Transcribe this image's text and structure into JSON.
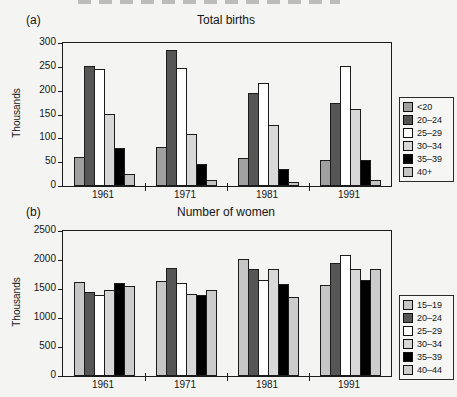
{
  "figure": {
    "description_note": "scanned two-panel grayscale bar chart figure",
    "background_color": "#f4f4f2"
  },
  "chart_data": [
    {
      "type": "bar",
      "panel_label": "(a)",
      "title": "Total births",
      "xlabel": "",
      "ylabel": "Thousands",
      "ylim": [
        0,
        300
      ],
      "ytick_step": 50,
      "grid": false,
      "legend_position": "right",
      "categories": [
        "1961",
        "1971",
        "1981",
        "1991"
      ],
      "series": [
        {
          "name": "<20",
          "color": "#a0a0a0",
          "values": [
            60,
            82,
            58,
            54
          ]
        },
        {
          "name": "20–24",
          "color": "#565656",
          "values": [
            251,
            286,
            196,
            175
          ]
        },
        {
          "name": "25–29",
          "color": "#ffffff",
          "values": [
            246,
            248,
            217,
            251
          ]
        },
        {
          "name": "30–34",
          "color": "#d8d8d8",
          "values": [
            152,
            110,
            127,
            162
          ]
        },
        {
          "name": "35–39",
          "color": "#000000",
          "values": [
            79,
            47,
            36,
            55
          ]
        },
        {
          "name": "40+",
          "color": "#c4c4c4",
          "values": [
            25,
            13,
            8,
            12
          ]
        }
      ]
    },
    {
      "type": "bar",
      "panel_label": "(b)",
      "title": "Number of women",
      "xlabel": "",
      "ylabel": "Thousands",
      "ylim": [
        0,
        2500
      ],
      "ytick_step": 500,
      "grid": false,
      "legend_position": "right",
      "categories": [
        "1961",
        "1971",
        "1981",
        "1991"
      ],
      "series": [
        {
          "name": "15–19",
          "color": "#c6c6c6",
          "values": [
            1620,
            1630,
            2010,
            1570
          ]
        },
        {
          "name": "20–24",
          "color": "#565656",
          "values": [
            1450,
            1870,
            1850,
            1940
          ]
        },
        {
          "name": "25–29",
          "color": "#ffffff",
          "values": [
            1400,
            1610,
            1660,
            2080
          ]
        },
        {
          "name": "30–34",
          "color": "#d8d8d8",
          "values": [
            1480,
            1420,
            1840,
            1840
          ]
        },
        {
          "name": "35–39",
          "color": "#000000",
          "values": [
            1610,
            1390,
            1590,
            1660
          ]
        },
        {
          "name": "40–44",
          "color": "#cccccc",
          "values": [
            1550,
            1480,
            1370,
            1840
          ]
        }
      ]
    }
  ]
}
